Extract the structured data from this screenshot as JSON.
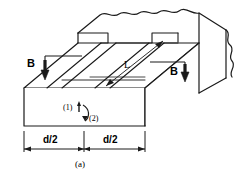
{
  "figure": {
    "caption": "(a)",
    "type": "isometric-engineering-diagram",
    "stroke_color": "#1a1a1a",
    "fill_color": "#ffffff",
    "background": "#ffffff"
  },
  "labels": {
    "b_left": "B",
    "b_right": "B",
    "length": "L",
    "face_one": "(1)",
    "face_two": "(2)",
    "dim_left": "d/2",
    "dim_right": "d/2",
    "caption": "(a)"
  },
  "icons": {
    "arrow_down_left": "arrow-down-icon",
    "arrow_down_right": "arrow-down-icon",
    "arrow_double_length": "double-arrow-icon",
    "arrow_curved": "curved-arrow-icon",
    "break_line_top": "wavy-break-icon",
    "break_line_right": "wavy-break-icon"
  },
  "dimension_line": {
    "segments": [
      "d/2",
      "d/2"
    ],
    "total": "d",
    "tick_style": "arrowhead"
  }
}
